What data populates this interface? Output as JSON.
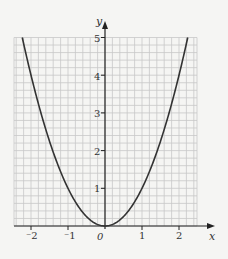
{
  "chart_data": {
    "type": "line",
    "title": "",
    "function": "y = x^2",
    "xlabel": "x",
    "ylabel": "y",
    "xlim": [
      -2.5,
      2.5
    ],
    "ylim": [
      0,
      5
    ],
    "grid": true,
    "grid_minor_step": 0.2,
    "x_ticks": [
      "-2",
      "-1",
      "0",
      "1",
      "2"
    ],
    "y_ticks": [
      "1",
      "2",
      "3",
      "4",
      "5"
    ],
    "origin_label": "0",
    "series": [
      {
        "name": "y = x^2",
        "x": [
          -2.24,
          -2,
          -1.5,
          -1,
          -0.5,
          0,
          0.5,
          1,
          1.5,
          2,
          2.24
        ],
        "y": [
          5,
          4,
          2.25,
          1,
          0.25,
          0,
          0.25,
          1,
          2.25,
          4,
          5
        ]
      }
    ],
    "colors": {
      "curve": "#333333",
      "grid": "#c8c8c8",
      "axis": "#222222"
    }
  },
  "labels": {
    "x_axis": "x",
    "y_axis": "y",
    "origin": "0",
    "x_tick_m2": "⁻2",
    "x_tick_m1": "⁻1",
    "x_tick_1": "1",
    "x_tick_2": "2",
    "y_tick_1": "1",
    "y_tick_2": "2",
    "y_tick_3": "3",
    "y_tick_4": "4",
    "y_tick_5": "5"
  }
}
